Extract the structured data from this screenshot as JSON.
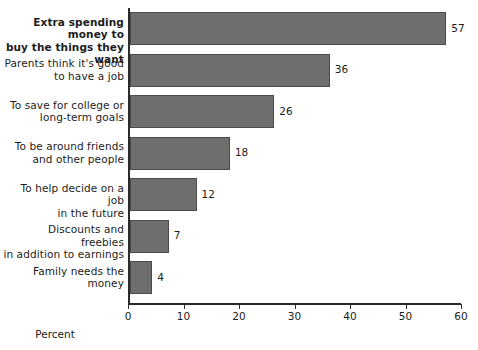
{
  "chart_data": {
    "type": "bar",
    "orientation": "horizontal",
    "title": "",
    "subtitle": "",
    "xlabel": "Percent",
    "ylabel": "",
    "categories": [
      "Extra spending money to\nbuy the things they want",
      "Parents think it's good\nto have a job",
      "To save for college or\nlong-term goals",
      "To be around friends\nand other people",
      "To help decide on a job\nin the future",
      "Discounts and freebies\nin addition to earnings",
      "Family needs the\nmoney"
    ],
    "values": [
      57,
      36,
      26,
      18,
      12,
      7,
      4
    ],
    "value_labels": [
      "57",
      "36",
      "26",
      "18",
      "12",
      "7",
      "4"
    ],
    "xlim": [
      0,
      60
    ],
    "xticks": [
      0,
      10,
      20,
      30,
      40,
      50,
      60
    ],
    "xtick_labels": [
      "0",
      "10",
      "20",
      "30",
      "40",
      "50",
      "60"
    ],
    "grid": false,
    "legend": false,
    "bar_color": "#6e6e6e",
    "bar_edge_color": "#4a4a4a",
    "axis_color": "#2b2b2b",
    "background_color": "#ffffff",
    "emphasized_category_index": 0
  }
}
